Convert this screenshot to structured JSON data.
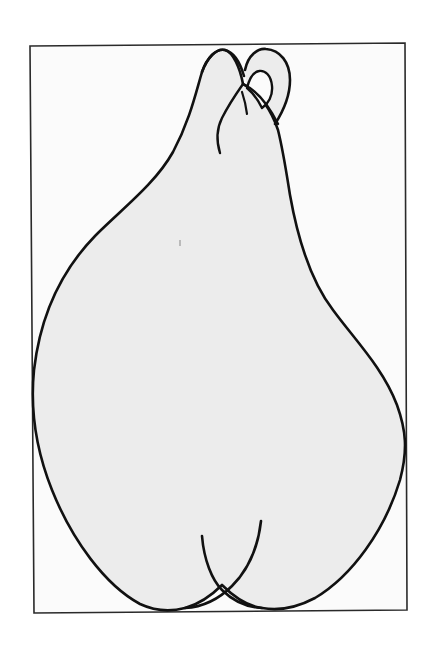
{
  "figure": {
    "colors": {
      "background": "#ffffff",
      "frame_bg": "#fbfbfb",
      "frame_stroke": "#2a2a2a",
      "shape_fill": "#ececec",
      "shape_stroke": "#111111"
    },
    "frame": {
      "top_left": [
        29,
        45
      ],
      "top_right": [
        405,
        43
      ],
      "bottom_right": [
        407,
        610
      ],
      "bottom_left": [
        34,
        613
      ]
    },
    "elements": [
      "frame",
      "pear-body",
      "top-loop",
      "top-knot-strand",
      "bottom-crossing-left-strand",
      "bottom-crossing-right-strand"
    ]
  }
}
